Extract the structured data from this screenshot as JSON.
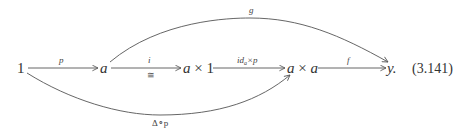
{
  "diagram": {
    "objects": {
      "one": "1",
      "a": "a",
      "a_times_1": "a × 1",
      "a_times_a": "a × a",
      "y": "y."
    },
    "arrows": {
      "p": {
        "from": "1",
        "to": "a",
        "label": "p"
      },
      "i": {
        "from": "a",
        "to": "a × 1",
        "label": "i",
        "sublabel": "≅"
      },
      "id_times_p": {
        "from": "a × 1",
        "to": "a × a",
        "label_main": "id",
        "label_sub": "a",
        "label_rest": "×p"
      },
      "f": {
        "from": "a × a",
        "to": "y",
        "label": "f"
      },
      "g": {
        "from": "a",
        "to": "y",
        "label": "g"
      },
      "delta_p": {
        "from": "1",
        "to": "a × a",
        "label": "Δ∘p"
      }
    },
    "equation_number": "(3.141)"
  }
}
